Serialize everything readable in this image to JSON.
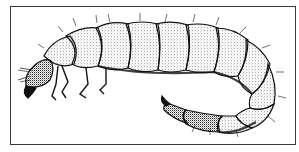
{
  "figure": {
    "style": "stippled pen-and-ink drawing",
    "colors": {
      "ink": "#111111",
      "background": "#ffffff",
      "frame": "#3a3a3a"
    }
  }
}
